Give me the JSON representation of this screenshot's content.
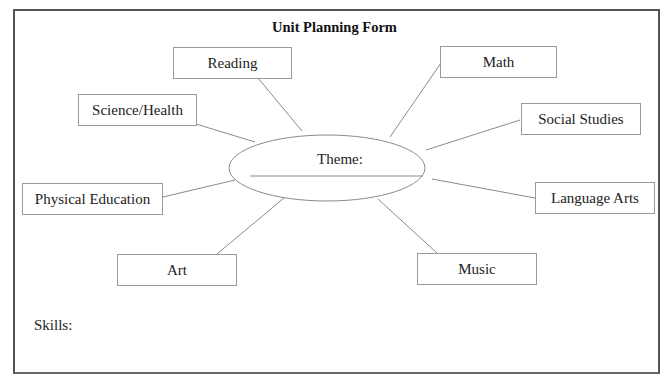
{
  "form": {
    "title": "Unit Planning Form",
    "theme_label": "Theme:",
    "skills_label": "Skills:"
  },
  "subjects": {
    "reading": "Reading",
    "math": "Math",
    "science_health": "Science/Health",
    "social_studies": "Social Studies",
    "physical_education": "Physical Education",
    "language_arts": "Language Arts",
    "art": "Art",
    "music": "Music"
  }
}
